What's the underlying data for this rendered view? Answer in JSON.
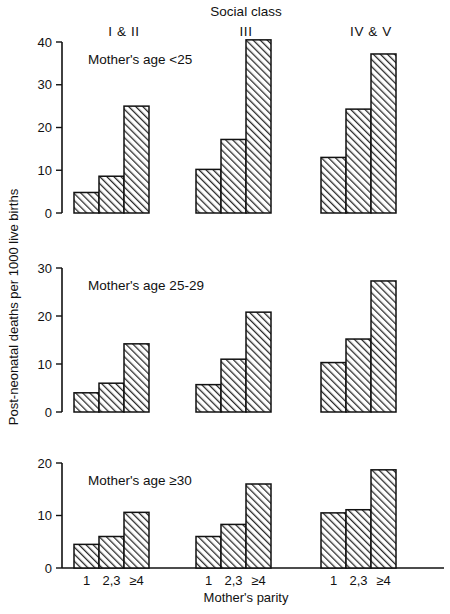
{
  "figure": {
    "super_title": "Social class",
    "x_axis_title": "Mother's parity",
    "y_axis_title": "Post-neonatal deaths per 1000 live births",
    "column_headers": [
      "I & II",
      "III",
      "IV & V"
    ],
    "category_labels": [
      "1",
      "2,3",
      "≥4"
    ],
    "panel_notes": [
      "Mother's age  <25",
      "Mother's age  25-29",
      "Mother's age  ≥30"
    ],
    "bar_fill_color": "#ffffff",
    "bar_hatch_color": "#2b2b2b",
    "axis_color": "#111111"
  },
  "chart_data": {
    "type": "bar",
    "title": "Social class",
    "xlabel": "Mother's parity",
    "ylabel": "Post-neonatal deaths per 1000 live births",
    "grid": false,
    "legend": "none",
    "categories": [
      "1",
      "2,3",
      "≥4"
    ],
    "groups": [
      "I & II",
      "III",
      "IV & V"
    ],
    "panels": [
      {
        "name": "Mother's age  <25",
        "ylim": [
          0,
          40
        ],
        "yticks": [
          0,
          10,
          20,
          30,
          40
        ],
        "series": [
          {
            "name": "I & II",
            "values": [
              4.8,
              8.6,
              25.0
            ]
          },
          {
            "name": "III",
            "values": [
              10.2,
              17.2,
              40.5
            ]
          },
          {
            "name": "IV & V",
            "values": [
              13.0,
              24.3,
              37.2
            ]
          }
        ]
      },
      {
        "name": "Mother's age  25-29",
        "ylim": [
          0,
          30
        ],
        "yticks": [
          0,
          10,
          20,
          30
        ],
        "series": [
          {
            "name": "I & II",
            "values": [
              4.0,
              6.0,
              14.2
            ]
          },
          {
            "name": "III",
            "values": [
              5.7,
              11.0,
              20.8
            ]
          },
          {
            "name": "IV & V",
            "values": [
              10.3,
              15.2,
              27.3
            ]
          }
        ]
      },
      {
        "name": "Mother's age  ≥30",
        "ylim": [
          0,
          20
        ],
        "yticks": [
          0,
          10,
          20
        ],
        "series": [
          {
            "name": "I & II",
            "values": [
              4.5,
              6.0,
              10.6
            ]
          },
          {
            "name": "III",
            "values": [
              6.0,
              8.3,
              16.0
            ]
          },
          {
            "name": "IV & V",
            "values": [
              10.5,
              11.1,
              18.7
            ]
          }
        ]
      }
    ]
  }
}
